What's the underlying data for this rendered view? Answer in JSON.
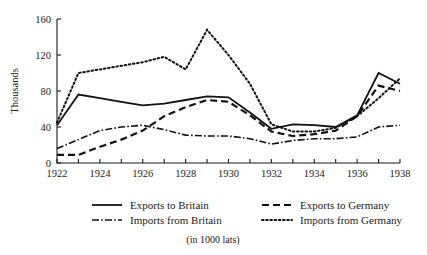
{
  "chart_data": {
    "type": "line",
    "title": "",
    "subtitle": "",
    "xlabel": "",
    "ylabel": "Thousands",
    "footnote": "(in 1000 lats)",
    "grid": false,
    "legend_position": "bottom",
    "xlim": [
      1922,
      1938
    ],
    "ylim": [
      0,
      160
    ],
    "yticks": [
      0,
      40,
      80,
      120,
      160
    ],
    "ytick_labels": [
      "0",
      "40",
      "80",
      "120",
      "160"
    ],
    "xticks": [
      1922,
      1923,
      1924,
      1925,
      1926,
      1927,
      1928,
      1929,
      1930,
      1931,
      1932,
      1933,
      1934,
      1935,
      1936,
      1937,
      1938
    ],
    "xtick_labels_shown": [
      "1922",
      "1924",
      "1926",
      "1928",
      "1930",
      "1932",
      "1934",
      "1936",
      "1938"
    ],
    "x": [
      1922,
      1923,
      1924,
      1925,
      1926,
      1927,
      1928,
      1929,
      1930,
      1931,
      1932,
      1933,
      1934,
      1935,
      1936,
      1937,
      1938
    ],
    "series": [
      {
        "name": "Exports to Britain",
        "style": "solid",
        "values": [
          42,
          76,
          72,
          68,
          64,
          66,
          70,
          74,
          73,
          56,
          38,
          43,
          42,
          40,
          53,
          100,
          88
        ]
      },
      {
        "name": "Imports from Britain",
        "style": "dash-dot",
        "values": [
          16,
          26,
          36,
          40,
          42,
          37,
          31,
          30,
          30,
          27,
          21,
          25,
          27,
          27,
          29,
          40,
          42
        ]
      },
      {
        "name": "Exports to Germany",
        "style": "dashed",
        "values": [
          9,
          9,
          18,
          26,
          36,
          52,
          62,
          70,
          68,
          53,
          35,
          30,
          32,
          36,
          52,
          86,
          80
        ]
      },
      {
        "name": "Imports from Germany",
        "style": "dotted",
        "values": [
          45,
          100,
          104,
          108,
          112,
          118,
          104,
          148,
          120,
          88,
          43,
          35,
          35,
          39,
          52,
          72,
          94
        ]
      }
    ],
    "legend": [
      {
        "label": "Exports to Britain",
        "style": "solid"
      },
      {
        "label": "Exports to Germany",
        "style": "dashed"
      },
      {
        "label": "Imports from Britain",
        "style": "dash-dot"
      },
      {
        "label": "Imports from Germany",
        "style": "dotted"
      }
    ],
    "colors": {
      "ink": "#111111",
      "background": "#ffffff"
    }
  }
}
